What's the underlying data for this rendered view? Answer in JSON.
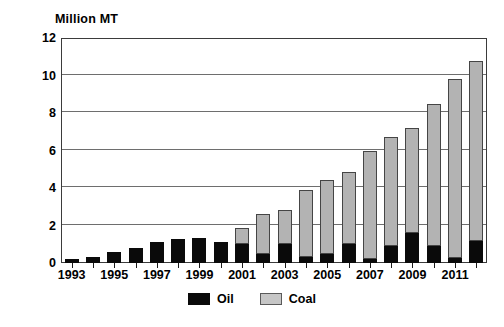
{
  "chart_data": {
    "type": "bar",
    "subtype": "stacked-vertical",
    "title": "",
    "xlabel": "",
    "ylabel": "Million MT",
    "ylim": [
      0,
      12
    ],
    "yticks": [
      0,
      2,
      4,
      6,
      8,
      10,
      12
    ],
    "ytick_labels": [
      "0",
      "2",
      "4",
      "6",
      "8",
      "10",
      "12"
    ],
    "grid": true,
    "grid_axis": "y",
    "legend_position": "bottom-center",
    "categories": [
      "1993",
      "1994",
      "1995",
      "1996",
      "1997",
      "1998",
      "1999",
      "2000",
      "2001",
      "2002",
      "2003",
      "2004",
      "2005",
      "2006",
      "2007",
      "2008",
      "2009",
      "2010",
      "2011",
      "2012"
    ],
    "xtick_labels_shown": [
      "1993",
      "1995",
      "1997",
      "1999",
      "2001",
      "2003",
      "2005",
      "2007",
      "2009",
      "2011"
    ],
    "series": [
      {
        "name": "Oil",
        "color": "#0a0a0a",
        "values": [
          0.2,
          0.3,
          0.6,
          0.8,
          1.1,
          1.3,
          1.35,
          1.1,
          1.0,
          0.5,
          1.0,
          0.3,
          0.5,
          1.0,
          0.2,
          0.9,
          1.6,
          0.9,
          0.25,
          1.2
        ]
      },
      {
        "name": "Coal",
        "color": "#b3b3b3",
        "values": [
          0.0,
          0.0,
          0.0,
          0.0,
          0.0,
          0.0,
          0.0,
          0.0,
          0.85,
          2.1,
          1.85,
          3.6,
          3.95,
          3.85,
          5.8,
          5.8,
          5.6,
          7.6,
          9.55,
          9.6
        ]
      }
    ],
    "totals": [
      0.2,
      0.3,
      0.6,
      0.8,
      1.1,
      1.3,
      1.35,
      1.1,
      1.85,
      2.6,
      2.85,
      3.9,
      4.45,
      4.85,
      6.0,
      6.7,
      7.2,
      8.5,
      9.8,
      10.8
    ],
    "legend": [
      {
        "label": "Oil",
        "swatch": "oil-swatch"
      },
      {
        "label": "Coal",
        "swatch": "coal-swatch"
      }
    ]
  }
}
